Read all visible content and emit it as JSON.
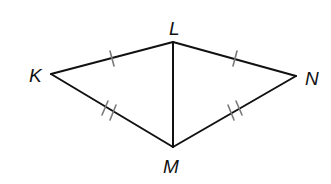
{
  "figure": {
    "type": "geometry-diagram",
    "colors": {
      "background": "#ffffff",
      "stroke": "#111111",
      "tick": "#7a7a7a"
    }
  },
  "vertices": {
    "K": {
      "label": "K",
      "x": 51,
      "y": 74
    },
    "L": {
      "label": "L",
      "x": 173,
      "y": 42
    },
    "N": {
      "label": "N",
      "x": 296,
      "y": 76
    },
    "M": {
      "label": "M",
      "x": 173,
      "y": 147
    }
  },
  "labels": {
    "K": "K",
    "L": "L",
    "N": "N",
    "M": "M"
  },
  "segments": [
    {
      "name": "KL",
      "from": "K",
      "to": "L",
      "ticks": 1
    },
    {
      "name": "LN",
      "from": "L",
      "to": "N",
      "ticks": 1
    },
    {
      "name": "KM",
      "from": "K",
      "to": "M",
      "ticks": 2
    },
    {
      "name": "MN",
      "from": "M",
      "to": "N",
      "ticks": 2
    },
    {
      "name": "LM",
      "from": "L",
      "to": "M",
      "ticks": 0
    }
  ],
  "congruences": [
    "KL ≅ LN",
    "KM ≅ MN"
  ]
}
